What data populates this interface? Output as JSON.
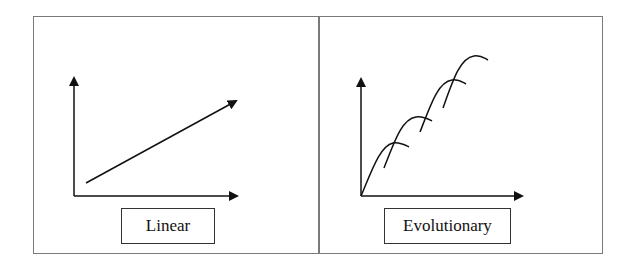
{
  "panels": [
    {
      "id": "linear",
      "label": "Linear",
      "description": "Straight-line growth arrow on x/y axes"
    },
    {
      "id": "evolutionary",
      "label": "Evolutionary",
      "description": "Series of overlapping S-curves stepping upward on x/y axes"
    }
  ],
  "colors": {
    "frame": "#7a7a7a",
    "line": "#111111",
    "background": "#ffffff"
  }
}
